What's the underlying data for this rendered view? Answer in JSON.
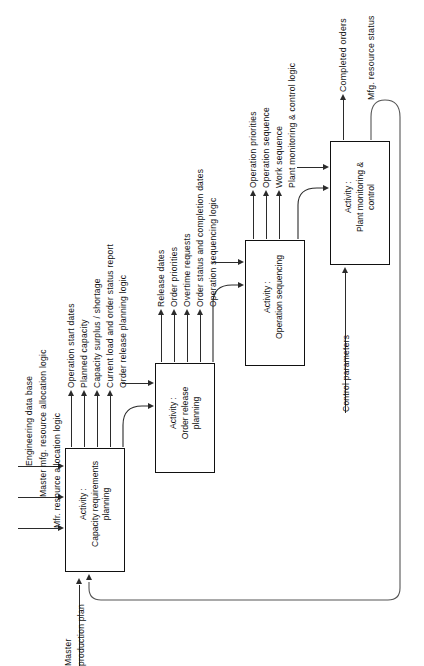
{
  "diagram": {
    "orientation": "rotated-90-ccw",
    "activities": [
      {
        "id": "a1",
        "prefix": "Activity :",
        "line1": "Capacity requirements",
        "line2": "planning"
      },
      {
        "id": "a2",
        "prefix": "Activity :",
        "line1": "Order release",
        "line2": "planning"
      },
      {
        "id": "a3",
        "prefix": "Activity :",
        "line1": "Operation sequencing",
        "line2": ""
      },
      {
        "id": "a4",
        "prefix": "Activity :",
        "line1": "Plant monitoring   &",
        "line2": "control"
      }
    ],
    "inputs_a1": [
      "Engineering data base",
      "Master mfg. resource allocation logic",
      "Mfr. resource allocation logic"
    ],
    "outputs_a1": [
      "Operation start  dates",
      "Planned capacity",
      "Capacity surplus / shortage",
      "Current load and order status report",
      "Order release  planning logic"
    ],
    "outputs_a2": [
      "Release  dates",
      "Order  priorities",
      "Overtime requests",
      "Order status and completion dates",
      "Operation sequencing logic"
    ],
    "outputs_a3": [
      "Operation priorities",
      "Operation sequence",
      "Work sequence",
      "Plant monitoring  &  control logic"
    ],
    "outputs_a4": [
      "Completed orders",
      "Mfg. resource status"
    ],
    "entry_label": "Master\nproduction plan",
    "entry_label_l1": "Master",
    "entry_label_l2": "production  plan",
    "control_label": "Control  parameters",
    "colors": {
      "line": "#2b2b2b",
      "thin_line": "#555555",
      "box_border": "#111111",
      "background": "#ffffff",
      "text": "#111111"
    }
  }
}
